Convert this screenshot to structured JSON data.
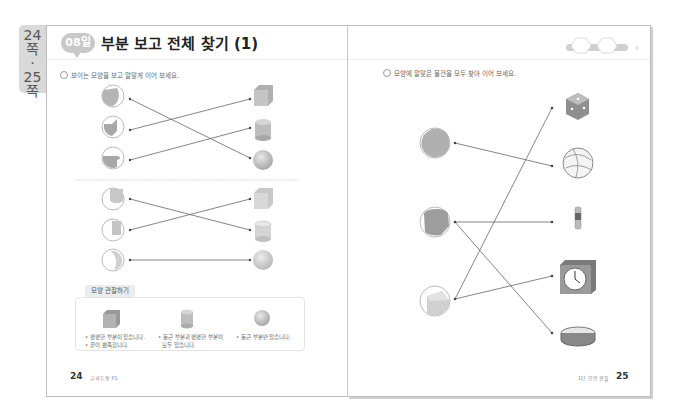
{
  "side_tab": {
    "lines": [
      "24",
      "쪽",
      "·",
      "25",
      "쪽"
    ]
  },
  "left_page": {
    "badge": "08일",
    "title": "부분 보고 전체 찾기 (1)",
    "instruction": "보이는 모양을 보고 알맞게 이어 보세요.",
    "observation": {
      "label": "모양 관찰하기",
      "items": [
        {
          "shape": "cube",
          "lines": [
            "• 평평한 부분이 있습니다.",
            "• 끝이 뾰족합니다."
          ]
        },
        {
          "shape": "cylinder",
          "lines": [
            "• 둥근 부분과 평평한 부분이",
            "모두 있습니다."
          ]
        },
        {
          "shape": "sphere",
          "lines": [
            "• 둥근 부분만 있습니다."
          ]
        }
      ]
    },
    "page_number": "24",
    "footer_text": "교과도형 P1",
    "matching_sets": [
      {
        "parts": [
          "sphere-part",
          "cube-part",
          "cylinder-part"
        ],
        "wholes": [
          "cube",
          "cylinder",
          "sphere"
        ],
        "connections": [
          [
            0,
            2
          ],
          [
            1,
            0
          ],
          [
            2,
            1
          ]
        ]
      },
      {
        "parts": [
          "cylinder-part",
          "cube-part",
          "sphere-part"
        ],
        "wholes": [
          "cube",
          "cylinder",
          "sphere"
        ],
        "connections": [
          [
            0,
            1
          ],
          [
            1,
            0
          ],
          [
            2,
            2
          ]
        ]
      }
    ]
  },
  "right_page": {
    "instruction": "모양에 알맞은 물건을 모두 찾아 이어 보세요.",
    "parts": [
      "sphere-part",
      "cylinder-part",
      "cube-part"
    ],
    "objects": [
      "dice",
      "volleyball",
      "battery",
      "clock",
      "tambourine"
    ],
    "connections": [
      [
        0,
        1
      ],
      [
        1,
        2
      ],
      [
        1,
        4
      ],
      [
        2,
        0
      ],
      [
        2,
        3
      ]
    ],
    "page_number": "25",
    "footer_text": "1단 모양 관찰"
  },
  "colors": {
    "border": "#bdbdbd",
    "shape_fill": "#bfbfbf",
    "line": "#666666",
    "badge": "#c8c8c8"
  }
}
